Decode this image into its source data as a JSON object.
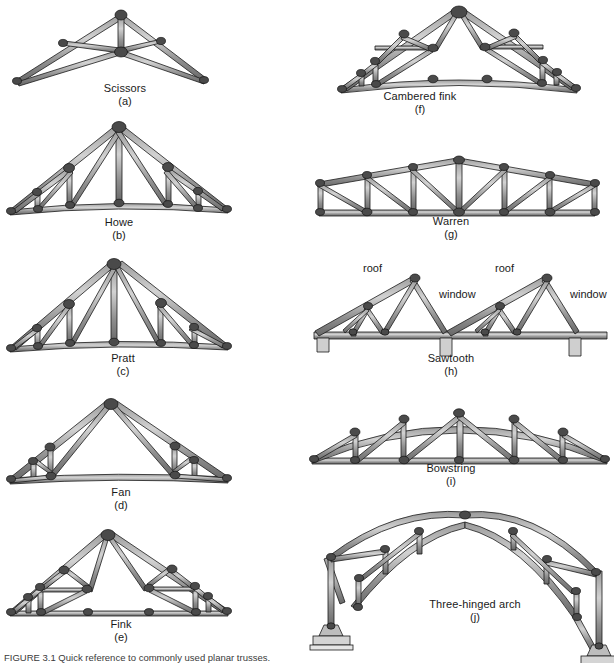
{
  "figure": {
    "caption_text": "FIGURE 3.1  Quick reference to commonly used planar trusses.",
    "background_color": "#ffffff",
    "member_fill_light": "#b9b9b9",
    "member_fill_dark": "#6d6d6d",
    "member_outline": "#1a1a1a",
    "joint_fill": "#555555",
    "support_fill": "#cfcfcf"
  },
  "trusses": [
    {
      "id": "scissors",
      "name": "Scissors",
      "letter": "(a)",
      "column": "left"
    },
    {
      "id": "howe",
      "name": "Howe",
      "letter": "(b)",
      "column": "left"
    },
    {
      "id": "pratt",
      "name": "Pratt",
      "letter": "(c)",
      "column": "left"
    },
    {
      "id": "fan",
      "name": "Fan",
      "letter": "(d)",
      "column": "left"
    },
    {
      "id": "fink",
      "name": "Fink",
      "letter": "(e)",
      "column": "left"
    },
    {
      "id": "cambered-fink",
      "name": "Cambered fink",
      "letter": "(f)",
      "column": "right"
    },
    {
      "id": "warren",
      "name": "Warren",
      "letter": "(g)",
      "column": "right"
    },
    {
      "id": "sawtooth",
      "name": "Sawtooth",
      "letter": "(h)",
      "column": "right",
      "annotations": [
        {
          "text": "roof",
          "id": "roof-left"
        },
        {
          "text": "window",
          "id": "window-left"
        },
        {
          "text": "roof",
          "id": "roof-right"
        },
        {
          "text": "window",
          "id": "window-right"
        }
      ]
    },
    {
      "id": "bowstring",
      "name": "Bowstring",
      "letter": "(i)",
      "column": "right"
    },
    {
      "id": "three-hinged-arch",
      "name": "Three-hinged arch",
      "letter": "(j)",
      "column": "right"
    }
  ]
}
